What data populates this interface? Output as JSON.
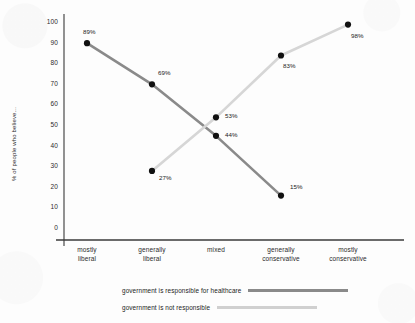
{
  "chart_data": {
    "type": "line",
    "title": "",
    "xlabel": "",
    "ylabel": "% of people who believe...",
    "ylim": [
      0,
      100
    ],
    "ytick_step": 10,
    "grid": false,
    "legend_position": "bottom",
    "categories": [
      "mostly liberal",
      "generally liberal",
      "mixed",
      "generally conservative",
      "mostly conservative"
    ],
    "category_lines": [
      [
        "mostly",
        "liberal"
      ],
      [
        "generally",
        "liberal"
      ],
      [
        "mixed"
      ],
      [
        "generally",
        "conservative"
      ],
      [
        "mostly",
        "conservative"
      ]
    ],
    "ytick_labels": [
      "100",
      "90",
      "80",
      "70",
      "60",
      "50",
      "40",
      "30",
      "20",
      "10",
      "0"
    ],
    "ytick_values": [
      100,
      90,
      80,
      70,
      60,
      50,
      40,
      30,
      20,
      10,
      0
    ],
    "series": [
      {
        "name": "government is responsible for healthcare",
        "color": "#8a8a8a",
        "values": [
          89,
          69,
          44,
          15,
          null
        ],
        "point_labels": [
          "89%",
          "69%",
          "44%",
          "15%",
          null
        ]
      },
      {
        "name": "government is not responsible",
        "color": "#d6d6d6",
        "values": [
          null,
          27,
          53,
          83,
          98
        ],
        "point_labels": [
          null,
          "27%",
          "53%",
          "83%",
          "98%"
        ]
      }
    ],
    "marker_color": "#111111"
  },
  "legend": {
    "items": [
      {
        "label": "government is responsible for healthcare",
        "color": "#8a8a8a",
        "swatch_width": 100
      },
      {
        "label": "government is not responsible",
        "color": "#d0d0d0",
        "swatch_width": 100
      }
    ]
  },
  "axis": {
    "axis_color": "#3a3a3a"
  }
}
